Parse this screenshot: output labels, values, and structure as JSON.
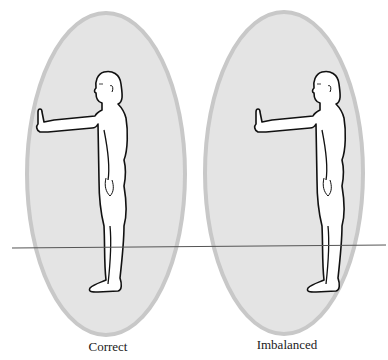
{
  "diagram": {
    "panels": [
      {
        "id": "correct",
        "label": "Correct",
        "center_x": 106,
        "figure_offset_x": 0
      },
      {
        "id": "imbalanced",
        "label": "Imbalanced",
        "center_x": 284,
        "figure_offset_x": 220
      }
    ],
    "colors": {
      "ellipse_fill": "#e4e4e4",
      "ellipse_stroke": "#c8c8c8",
      "figure_fill": "#ffffff",
      "figure_stroke": "#111111",
      "ground_line": "#555555"
    }
  }
}
